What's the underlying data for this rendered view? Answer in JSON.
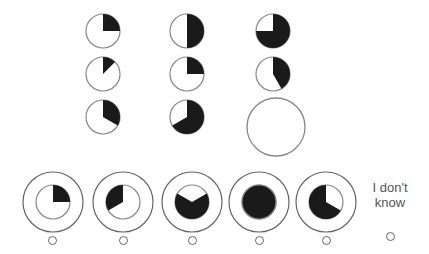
{
  "puzzle": {
    "grid": {
      "stroke_color": "#888888",
      "fill_color": "#1a1a1a",
      "radius": 17,
      "cells": [
        {
          "row": 1,
          "col": 1,
          "cx": 103,
          "cy": 31,
          "start_deg": 0,
          "sweep_deg": 90
        },
        {
          "row": 1,
          "col": 2,
          "cx": 187,
          "cy": 31,
          "start_deg": 0,
          "sweep_deg": 180
        },
        {
          "row": 1,
          "col": 3,
          "cx": 273,
          "cy": 31,
          "start_deg": 0,
          "sweep_deg": 270
        },
        {
          "row": 2,
          "col": 1,
          "cx": 103,
          "cy": 74,
          "start_deg": 0,
          "sweep_deg": 45
        },
        {
          "row": 2,
          "col": 2,
          "cx": 187,
          "cy": 74,
          "start_deg": 0,
          "sweep_deg": 90
        },
        {
          "row": 2,
          "col": 3,
          "cx": 273,
          "cy": 74,
          "start_deg": 0,
          "sweep_deg": 150
        },
        {
          "row": 3,
          "col": 1,
          "cx": 103,
          "cy": 117,
          "start_deg": 0,
          "sweep_deg": 120
        },
        {
          "row": 3,
          "col": 2,
          "cx": 187,
          "cy": 117,
          "start_deg": 0,
          "sweep_deg": 240
        }
      ],
      "missing": {
        "row": 3,
        "col": 3,
        "cx": 276,
        "cy": 127,
        "r": 29
      }
    },
    "options": [
      {
        "id": "A",
        "cx": 53,
        "cy": 202,
        "start_deg": 0,
        "sweep_deg": 90,
        "radio_x": 52,
        "radio_y": 240
      },
      {
        "id": "B",
        "cx": 123,
        "cy": 202,
        "start_deg": 240,
        "sweep_deg": 120,
        "radio_x": 123,
        "radio_y": 240
      },
      {
        "id": "C",
        "cx": 192,
        "cy": 202,
        "start_deg": 60,
        "sweep_deg": 240,
        "radio_x": 192,
        "radio_y": 240
      },
      {
        "id": "D",
        "cx": 259,
        "cy": 202,
        "start_deg": 0,
        "sweep_deg": 360,
        "radio_x": 259,
        "radio_y": 240
      },
      {
        "id": "E",
        "cx": 326,
        "cy": 202,
        "start_deg": 120,
        "sweep_deg": 240,
        "radio_x": 326,
        "radio_y": 240
      }
    ],
    "option_outer_r": 30,
    "option_inner_r": 17,
    "dont_know": {
      "line1": "I don't",
      "line2": "know",
      "radio_x": 390,
      "radio_y": 236
    }
  }
}
